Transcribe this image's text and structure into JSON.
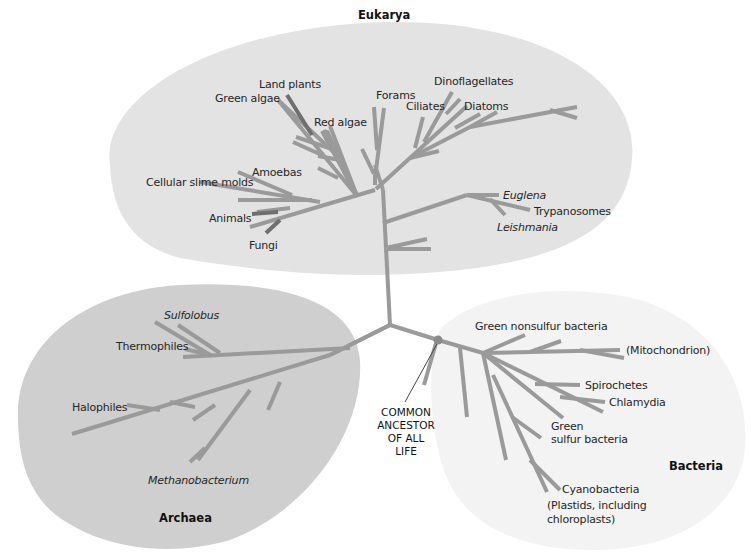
{
  "diagram": {
    "type": "phylogenetic-tree",
    "colors": {
      "eukarya_region": "#e3e3e3",
      "archaea_region": "#cfcfcf",
      "bacteria_region": "#f3f3f3",
      "branch": "#9a9a9a",
      "branch_dark": "#6f6f6f",
      "ancestor_node": "#8a8a8a",
      "text": "#262626"
    },
    "domains": {
      "eukarya": {
        "label": "Eukarya",
        "taxa": {
          "land_plants": "Land plants",
          "green_algae": "Green algae",
          "red_algae": "Red algae",
          "forams": "Forams",
          "ciliates": "Ciliates",
          "dinoflagellates": "Dinoflagellates",
          "diatoms": "Diatoms",
          "cellular_slime_molds": "Cellular slime molds",
          "amoebas": "Amoebas",
          "animals": "Animals",
          "fungi": "Fungi",
          "euglena": "Euglena",
          "trypanosomes": "Trypanosomes",
          "leishmania": "Leishmania"
        }
      },
      "archaea": {
        "label": "Archaea",
        "taxa": {
          "sulfolobus": "Sulfolobus",
          "thermophiles": "Thermophiles",
          "halophiles": "Halophiles",
          "methanobacterium": "Methanobacterium"
        }
      },
      "bacteria": {
        "label": "Bacteria",
        "taxa": {
          "green_nonsulfur": "Green nonsulfur bacteria",
          "mitochondrion": "(Mitochondrion)",
          "spirochetes": "Spirochetes",
          "chlamydia": "Chlamydia",
          "green_sulfur_1": "Green",
          "green_sulfur_2": "sulfur bacteria",
          "cyanobacteria": "Cyanobacteria",
          "plastids_1": "(Plastids, including",
          "plastids_2": "chloroplasts)"
        }
      }
    },
    "root": {
      "line1": "COMMON",
      "line2": "ANCESTOR",
      "line3": "OF ALL",
      "line4": "LIFE"
    }
  }
}
